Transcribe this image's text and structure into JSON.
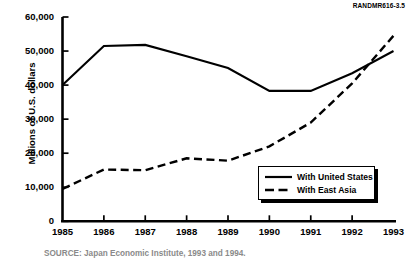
{
  "figure": {
    "code": "RANDMR616-3.5",
    "source_note": "SOURCE: Japan Economic Institute, 1993 and 1994."
  },
  "chart_data": {
    "type": "line",
    "title": "",
    "xlabel": "",
    "ylabel": "Millions of U.S. dollars",
    "categories": [
      "1985",
      "1986",
      "1987",
      "1988",
      "1989",
      "1990",
      "1991",
      "1992",
      "1993"
    ],
    "x": [
      1985,
      1986,
      1987,
      1988,
      1989,
      1990,
      1991,
      1992,
      1993
    ],
    "xlim": [
      1985,
      1993
    ],
    "ylim": [
      0,
      60000
    ],
    "yticks": [
      0,
      10000,
      20000,
      30000,
      40000,
      50000,
      60000
    ],
    "ytick_labels": [
      "0",
      "10,000",
      "20,000",
      "30,000",
      "40,000",
      "50,000",
      "60,000"
    ],
    "grid": false,
    "legend_position": "lower-right",
    "series": [
      {
        "name": "With United States",
        "style": "solid",
        "color": "#000000",
        "values": [
          40000,
          51500,
          51800,
          48500,
          45000,
          38300,
          38300,
          43500,
          50000
        ]
      },
      {
        "name": "With East Asia",
        "style": "dashed",
        "color": "#000000",
        "values": [
          9500,
          15200,
          15000,
          18500,
          17800,
          22000,
          29000,
          40500,
          54500
        ]
      }
    ]
  }
}
